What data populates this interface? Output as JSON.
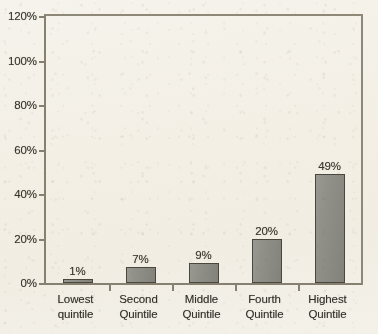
{
  "chart_data": {
    "type": "bar",
    "title": "",
    "subtitle": "",
    "xlabel": "",
    "ylabel": "",
    "categories": [
      "Lowest quintile",
      "Second Quintile",
      "Middle Quintile",
      "Fourth Quintile",
      "Highest Quintile"
    ],
    "category_lines": [
      [
        "Lowest",
        "quintile"
      ],
      [
        "Second",
        "Quintile"
      ],
      [
        "Middle",
        "Quintile"
      ],
      [
        "Fourth",
        "Quintile"
      ],
      [
        "Highest",
        "Quintile"
      ]
    ],
    "values": [
      1,
      7,
      9,
      20,
      49
    ],
    "value_labels": [
      "1%",
      "7%",
      "9%",
      "20%",
      "49%"
    ],
    "ylim": [
      0,
      120
    ],
    "ytick_values": [
      0,
      20,
      40,
      60,
      80,
      100,
      120
    ],
    "ytick_labels": [
      "0%",
      "20%",
      "40%",
      "60%",
      "80%",
      "100%",
      "120%"
    ],
    "grid": false,
    "legend": null,
    "colors": {
      "bar_fill": "#8e8d86",
      "bar_edge": "#4a473f",
      "axis": "#85806f",
      "text": "#34312a",
      "background": "#f4f1e8"
    }
  }
}
